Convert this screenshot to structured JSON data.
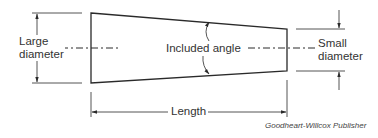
{
  "diagram": {
    "labels": {
      "large_diameter_line1": "Large",
      "large_diameter_line2": "diameter",
      "small_diameter_line1": "Small",
      "small_diameter_line2": "diameter",
      "included_angle": "Included angle",
      "length": "Length"
    },
    "credit": "Goodheart-Willcox Publisher",
    "colors": {
      "line": "#2a2a2a",
      "text": "#333333",
      "background": "#ffffff"
    }
  }
}
